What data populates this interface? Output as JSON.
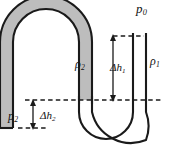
{
  "diagram": {
    "type": "physics-schematic",
    "background_color": "#ffffff",
    "outline_color": "#1a1a1a",
    "fluid2_fill_color": "#bdbdbd",
    "fluid1_fill_color": "#ffffff",
    "labels": {
      "ambient_pressure": "p",
      "ambient_pressure_sub": "0",
      "density_right": "ρ",
      "density_right_sub": "1",
      "density_left": "ρ",
      "density_left_sub": "2",
      "pressure_left": "p",
      "pressure_left_sub": "2",
      "height_diff_1": "Δh",
      "height_diff_1_sub": "1",
      "height_diff_2": "Δh",
      "height_diff_2_sub": "2"
    },
    "elements": {
      "left_limb": "closed-end vertical tube, shaded",
      "top_bend": "inverted-U bend at top-left, shaded",
      "middle_limb": "descending vertical tube, shaded",
      "bottom_bend": "U bend at bottom-right, unshaded",
      "right_limb": "open-end vertical tube, unshaded",
      "upper_reference_line": "dashed horizontal at right-tube meniscus",
      "lower_reference_line": "dashed horizontal at interface level",
      "bottom_reference_line": "dashed horizontal at closed left end"
    }
  }
}
